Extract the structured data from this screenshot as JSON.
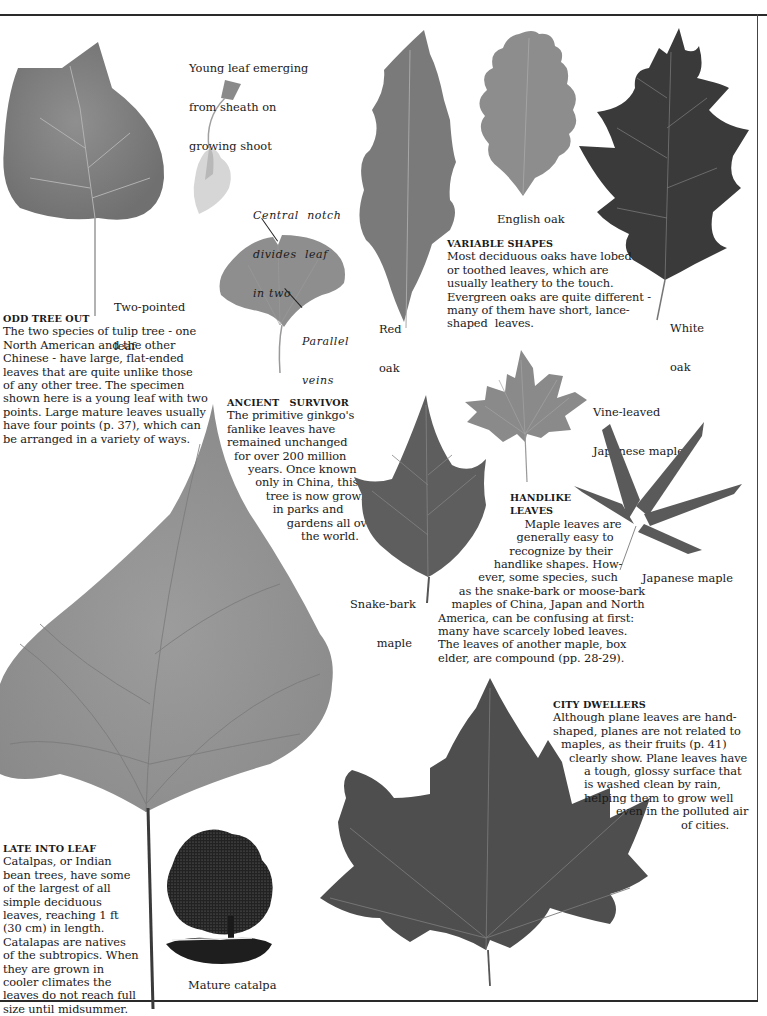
{
  "page": {
    "background": "#ffffff",
    "text_color": "#1a1a1a"
  },
  "sections": {
    "odd_tree_out": {
      "heading": "ODD TREE OUT",
      "lines": [
        "The two species of tulip tree - one",
        "North American and the other",
        "Chinese - have large, flat-ended",
        "leaves that are quite unlike those",
        "of any other tree. The specimen",
        "shown here is a young leaf with two",
        "points. Large mature leaves usually",
        "have four points (p. 37), which can",
        "be arranged in a variety of ways."
      ]
    },
    "ancient_survivor": {
      "heading": "ANCIENT   SURVIVOR",
      "lines": [
        "The primitive ginkgo's",
        "fanlike leaves have",
        "remained unchanged",
        "  for over 200 million",
        "      years. Once known",
        "        only in China, this",
        "           tree is now grown",
        "             in parks and",
        "                 gardens all over",
        "                     the world."
      ]
    },
    "variable_shapes": {
      "heading": "VARIABLE SHAPES",
      "lines": [
        "Most deciduous oaks have lobed",
        "or toothed leaves, which are",
        "usually leathery to the touch.",
        "Evergreen oaks are quite different -",
        "many of them have short, lance-",
        "shaped  leaves."
      ]
    },
    "handlike_leaves": {
      "heading_line1": "HANDLIKE",
      "heading_line2": "LEAVES",
      "lines": [
        "Maple leaves are",
        "generally easy to",
        "recognize by their",
        "handlike shapes. How-",
        "ever, some species, such",
        "as the snake-bark or moose-bark",
        "maples of China, Japan and North",
        "America, can be confusing at first:",
        "many have scarcely lobed leaves.",
        "The leaves of another maple, box",
        "elder, are compound (pp. 28-29)."
      ]
    },
    "city_dwellers": {
      "heading": "CITY DWELLERS",
      "lines": [
        "Although plane leaves are hand-",
        "shaped, planes are not related to",
        "maples, as their fruits (p. 41)",
        "clearly show. Plane leaves have",
        "a tough, glossy surface that",
        "is washed clean by rain,",
        "helping them to grow well",
        "even in the polluted air",
        "of cities."
      ]
    },
    "late_into_leaf": {
      "heading": "LATE INTO LEAF",
      "lines": [
        "Catalpas, or Indian",
        "bean trees, have some",
        "of the largest of all",
        "simple deciduous",
        "leaves, reaching 1 ft",
        "(30 cm) in length.",
        "Catalapas are natives",
        "of the subtropics. When",
        "they are grown in",
        "cooler climates the",
        "leaves do not reach full",
        "size until midsummer."
      ]
    }
  },
  "labels": {
    "young_leaf": [
      "Young leaf emerging",
      "from sheath on",
      "growing shoot"
    ],
    "two_pointed": [
      "Two-pointed",
      "leaf"
    ],
    "central_notch": [
      "Central  notch",
      "divides  leaf",
      "in two"
    ],
    "parallel_veins": [
      "Parallel",
      "veins"
    ],
    "red_oak": [
      "Red",
      "oak"
    ],
    "english_oak": "English oak",
    "white_oak": [
      "White",
      "oak"
    ],
    "vine_leaved": [
      "Vine-leaved",
      "Japanese maple"
    ],
    "snake_bark": [
      "Snake-bark",
      "maple"
    ],
    "japanese_maple": "Japanese maple",
    "mature_catalpa": "Mature catalpa"
  },
  "specimens": [
    {
      "id": "tulip-leaf",
      "tone": "#8a8a8a"
    },
    {
      "id": "young-shoot",
      "tone": "#c8c8c8"
    },
    {
      "id": "ginkgo-leaf",
      "tone": "#8e8e8e"
    },
    {
      "id": "red-oak-leaf",
      "tone": "#7a7a7a"
    },
    {
      "id": "english-oak-leaf",
      "tone": "#8d8d8d"
    },
    {
      "id": "white-oak-leaf",
      "tone": "#3a3a3a"
    },
    {
      "id": "vine-leaved-maple-leaf",
      "tone": "#8a8a8a"
    },
    {
      "id": "snake-bark-maple-leaf",
      "tone": "#5e5e5e"
    },
    {
      "id": "japanese-maple-leaf",
      "tone": "#5a5a5a"
    },
    {
      "id": "catalpa-leaf",
      "tone": "#9a9a9a"
    },
    {
      "id": "plane-leaf",
      "tone": "#4e4e4e"
    },
    {
      "id": "catalpa-tree-engraving",
      "tone": "#1e1e1e"
    }
  ]
}
